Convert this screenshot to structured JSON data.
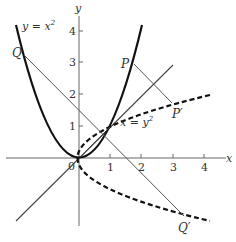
{
  "diagram": {
    "axes": {
      "x_label": "x",
      "y_label": "y",
      "origin_label": "0",
      "x_ticks": [
        "1",
        "2",
        "3",
        "4"
      ],
      "y_ticks": [
        "1",
        "2",
        "3",
        "4"
      ]
    },
    "curves": {
      "parabola_label": "y = x²",
      "parabola_label_base": "y = x",
      "parabola_label_exp": "2",
      "inverse_label_base": "x = y",
      "inverse_label_exp": "2"
    },
    "points": {
      "P": "P",
      "P_prime": "P′",
      "Q": "Q",
      "Q_prime": "Q′",
      "O": "0"
    },
    "colors": {
      "curve": "#111111",
      "thin_line": "#555555",
      "axis": "#666666",
      "text": "#333333"
    }
  }
}
